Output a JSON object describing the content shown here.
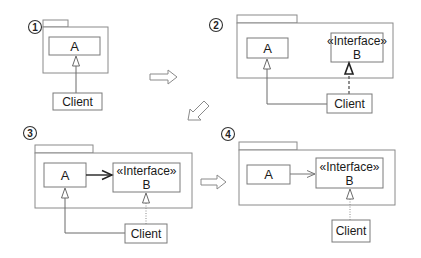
{
  "diagram": {
    "type": "uml-refactoring-steps",
    "steps": [
      {
        "number": "1",
        "package": true,
        "classes": [
          {
            "name": "A"
          }
        ],
        "client": "Client",
        "relations": [
          {
            "from": "Client",
            "to": "A",
            "kind": "generalization-solid"
          }
        ]
      },
      {
        "number": "2",
        "package": true,
        "classes": [
          {
            "name": "A"
          },
          {
            "stereotype": "«Interface»",
            "name": "B"
          }
        ],
        "client": "Client",
        "relations": [
          {
            "from": "Client",
            "to": "A",
            "kind": "generalization-solid"
          },
          {
            "from": "Client",
            "to": "B",
            "kind": "realization-dashed-bold"
          }
        ]
      },
      {
        "number": "3",
        "package": true,
        "classes": [
          {
            "name": "A"
          },
          {
            "stereotype": "«Interface»",
            "name": "B"
          }
        ],
        "client": "Client",
        "relations": [
          {
            "from": "Client",
            "to": "A",
            "kind": "generalization-solid"
          },
          {
            "from": "Client",
            "to": "B",
            "kind": "realization-dotted"
          },
          {
            "from": "A",
            "to": "B",
            "kind": "dependency-bold"
          }
        ]
      },
      {
        "number": "4",
        "package": true,
        "classes": [
          {
            "name": "A"
          },
          {
            "stereotype": "«Interface»",
            "name": "B"
          }
        ],
        "client": "Client",
        "relations": [
          {
            "from": "Client",
            "to": "B",
            "kind": "realization-dotted"
          },
          {
            "from": "A",
            "to": "B",
            "kind": "dependency-thin"
          }
        ]
      }
    ],
    "transitions": [
      {
        "from": "1",
        "to": "2",
        "direction": "right"
      },
      {
        "from": "2",
        "to": "3",
        "direction": "down-left"
      },
      {
        "from": "3",
        "to": "4",
        "direction": "right"
      }
    ]
  },
  "labels": {
    "s1": {
      "num": "1",
      "a": "A",
      "client": "Client"
    },
    "s2": {
      "num": "2",
      "a": "A",
      "stereo": "«Interface»",
      "b": "B",
      "client": "Client"
    },
    "s3": {
      "num": "3",
      "a": "A",
      "stereo": "«Interface»",
      "b": "B",
      "client": "Client"
    },
    "s4": {
      "num": "4",
      "a": "A",
      "stereo": "«Interface»",
      "b": "B",
      "client": "Client"
    }
  },
  "colors": {
    "background": "#ffffff",
    "stroke": "#7a7a7a",
    "text": "#1a1a1a"
  }
}
